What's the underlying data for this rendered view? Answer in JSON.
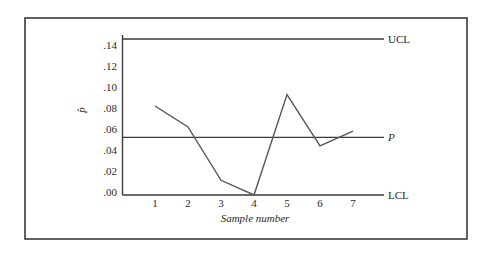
{
  "chart_data": {
    "type": "line",
    "title": "",
    "xlabel": "Sample number",
    "ylabel": "p̂",
    "categories": [
      "1",
      "2",
      "3",
      "4",
      "5",
      "6",
      "7"
    ],
    "x": [
      1,
      2,
      3,
      4,
      5,
      6,
      7
    ],
    "series": [
      {
        "name": "p̂",
        "values": [
          0.085,
          0.065,
          0.014,
          0.0,
          0.096,
          0.047,
          0.061
        ]
      }
    ],
    "control_lines": [
      {
        "name": "UCL",
        "value": 0.149,
        "italic": false
      },
      {
        "name": "P",
        "value": 0.055,
        "italic": true
      },
      {
        "name": "LCL",
        "value": 0.0,
        "italic": false
      }
    ],
    "y_ticks": [
      ".00",
      ".02",
      ".04",
      ".06",
      ".08",
      ".10",
      ".12",
      ".14"
    ],
    "y_tick_values": [
      0.0,
      0.02,
      0.04,
      0.06,
      0.08,
      0.1,
      0.12,
      0.14
    ],
    "ylim": [
      0,
      0.15
    ],
    "xlim": [
      0.35,
      7.9
    ],
    "grid": false,
    "legend": "none"
  },
  "colors": {
    "frame": "#3a3a3a",
    "line": "#555555",
    "text": "#2a2a2a",
    "background": "#ffffff"
  }
}
